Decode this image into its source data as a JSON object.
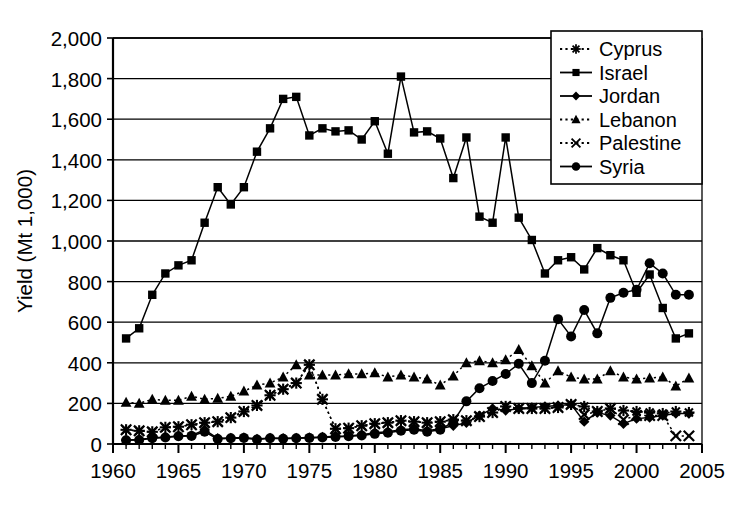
{
  "chart_data": {
    "type": "line",
    "title": "",
    "subtitle": "",
    "xlabel": "",
    "ylabel": "Yield (Mt 1,000)",
    "xlim": [
      1960,
      2005
    ],
    "ylim": [
      0,
      2000
    ],
    "xticks": [
      "1960",
      "1965",
      "1970",
      "1975",
      "1980",
      "1985",
      "1990",
      "1995",
      "2000",
      "2005"
    ],
    "xtick_values": [
      1960,
      1965,
      1970,
      1975,
      1980,
      1985,
      1990,
      1995,
      2000,
      2005
    ],
    "x_minor_tick_interval": 1,
    "yticks": [
      "0",
      "200",
      "400",
      "600",
      "800",
      "1,000",
      "1,200",
      "1,400",
      "1,600",
      "1,800",
      "2,000"
    ],
    "ytick_values": [
      0,
      200,
      400,
      600,
      800,
      1000,
      1200,
      1400,
      1600,
      1800,
      2000
    ],
    "grid": "horizontal",
    "legend_position": "top-right",
    "legend_entries": [
      "Cyprus",
      "Israel",
      "Jordan",
      "Lebanon",
      "Palestine",
      "Syria"
    ],
    "series": [
      {
        "name": "Cyprus",
        "marker": "asterisk",
        "linestyle": "dotted",
        "x": [
          1961,
          1962,
          1963,
          1964,
          1965,
          1966,
          1967,
          1968,
          1969,
          1970,
          1971,
          1972,
          1973,
          1974,
          1975,
          1976,
          1977,
          1978,
          1979,
          1980,
          1981,
          1982,
          1983,
          1984,
          1985,
          1986,
          1987,
          1988,
          1989,
          1990,
          1991,
          1992,
          1993,
          1994,
          1995,
          1996,
          1997,
          1998,
          1999,
          2000,
          2001,
          2002,
          2003,
          2004
        ],
        "values": [
          70,
          65,
          60,
          82,
          85,
          95,
          105,
          110,
          130,
          160,
          190,
          240,
          270,
          300,
          390,
          220,
          75,
          78,
          90,
          100,
          105,
          115,
          110,
          105,
          110,
          120,
          115,
          135,
          155,
          185,
          175,
          175,
          175,
          180,
          195,
          185,
          160,
          175,
          165,
          160,
          155,
          150,
          160,
          155
        ]
      },
      {
        "name": "Israel",
        "marker": "square",
        "linestyle": "solid",
        "x": [
          1961,
          1962,
          1963,
          1964,
          1965,
          1966,
          1967,
          1968,
          1969,
          1970,
          1971,
          1972,
          1973,
          1974,
          1975,
          1976,
          1977,
          1978,
          1979,
          1980,
          1981,
          1982,
          1983,
          1984,
          1985,
          1986,
          1987,
          1988,
          1989,
          1990,
          1991,
          1992,
          1993,
          1994,
          1995,
          1996,
          1997,
          1998,
          1999,
          2000,
          2001,
          2002,
          2003,
          2004
        ],
        "values": [
          520,
          570,
          735,
          840,
          880,
          905,
          1090,
          1265,
          1180,
          1265,
          1440,
          1555,
          1700,
          1710,
          1520,
          1555,
          1540,
          1545,
          1500,
          1590,
          1430,
          1810,
          1535,
          1540,
          1505,
          1310,
          1510,
          1120,
          1090,
          1510,
          1115,
          1005,
          840,
          905,
          920,
          860,
          965,
          930,
          905,
          745,
          835,
          670,
          520,
          545
        ]
      },
      {
        "name": "Jordan",
        "marker": "diamond",
        "linestyle": "solid",
        "x": [
          1961,
          1962,
          1963,
          1964,
          1965,
          1966,
          1967,
          1968,
          1969,
          1970,
          1971,
          1972,
          1973,
          1974,
          1975,
          1976,
          1977,
          1978,
          1979,
          1980,
          1981,
          1982,
          1983,
          1984,
          1985,
          1986,
          1987,
          1988,
          1989,
          1990,
          1991,
          1992,
          1993,
          1994,
          1995,
          1996,
          1997,
          1998,
          1999,
          2000,
          2001,
          2002,
          2003,
          2004
        ],
        "values": [
          20,
          22,
          30,
          35,
          40,
          42,
          70,
          28,
          30,
          32,
          25,
          30,
          28,
          30,
          32,
          35,
          38,
          40,
          45,
          55,
          60,
          70,
          75,
          65,
          75,
          90,
          105,
          140,
          175,
          165,
          175,
          180,
          185,
          190,
          195,
          110,
          155,
          140,
          100,
          125,
          130,
          140,
          150,
          150
        ]
      },
      {
        "name": "Lebanon",
        "marker": "triangle",
        "linestyle": "dotted",
        "x": [
          1961,
          1962,
          1963,
          1964,
          1965,
          1966,
          1967,
          1968,
          1969,
          1970,
          1971,
          1972,
          1973,
          1974,
          1975,
          1976,
          1977,
          1978,
          1979,
          1980,
          1981,
          1982,
          1983,
          1984,
          1985,
          1986,
          1987,
          1988,
          1989,
          1990,
          1991,
          1992,
          1993,
          1994,
          1995,
          1996,
          1997,
          1998,
          1999,
          2000,
          2001,
          2002,
          2003,
          2004
        ],
        "values": [
          205,
          200,
          220,
          215,
          215,
          235,
          220,
          225,
          235,
          260,
          290,
          300,
          330,
          390,
          340,
          340,
          340,
          345,
          345,
          350,
          330,
          340,
          330,
          320,
          290,
          335,
          400,
          410,
          400,
          415,
          465,
          385,
          300,
          360,
          330,
          320,
          320,
          360,
          330,
          320,
          325,
          330,
          285,
          325
        ]
      },
      {
        "name": "Palestine",
        "marker": "cross",
        "linestyle": "dotted",
        "x": [
          1961,
          1962,
          1963,
          1964,
          1965,
          1966,
          1967,
          1968,
          1969,
          1970,
          1971,
          1972,
          1973,
          1974,
          1975,
          1976,
          1977,
          1978,
          1979,
          1980,
          1981,
          1982,
          1983,
          1984,
          1985,
          1986,
          1987,
          1988,
          1989,
          1990,
          1991,
          1992,
          1993,
          1994,
          1995,
          1996,
          1997,
          1998,
          1999,
          2000,
          2001,
          2002,
          2003,
          2004
        ],
        "values": [
          70,
          65,
          60,
          82,
          85,
          95,
          105,
          110,
          130,
          160,
          190,
          240,
          270,
          300,
          390,
          220,
          75,
          78,
          90,
          100,
          105,
          115,
          110,
          105,
          110,
          120,
          115,
          135,
          155,
          185,
          175,
          175,
          175,
          180,
          195,
          145,
          160,
          175,
          120,
          140,
          140,
          140,
          40,
          40
        ]
      },
      {
        "name": "Syria",
        "marker": "circle",
        "linestyle": "solid",
        "x": [
          1961,
          1962,
          1963,
          1964,
          1965,
          1966,
          1967,
          1968,
          1969,
          1970,
          1971,
          1972,
          1973,
          1974,
          1975,
          1976,
          1977,
          1978,
          1979,
          1980,
          1981,
          1982,
          1983,
          1984,
          1985,
          1986,
          1987,
          1988,
          1989,
          1990,
          1991,
          1992,
          1993,
          1994,
          1995,
          1996,
          1997,
          1998,
          1999,
          2000,
          2001,
          2002,
          2003,
          2004
        ],
        "values": [
          18,
          20,
          28,
          32,
          38,
          40,
          60,
          25,
          28,
          30,
          22,
          28,
          26,
          28,
          30,
          32,
          35,
          38,
          42,
          50,
          55,
          65,
          70,
          60,
          70,
          110,
          210,
          275,
          310,
          345,
          395,
          300,
          410,
          615,
          530,
          660,
          545,
          720,
          745,
          760,
          890,
          840,
          735,
          735
        ]
      }
    ]
  },
  "axes": {
    "y_title": "Yield (Mt 1,000)"
  }
}
